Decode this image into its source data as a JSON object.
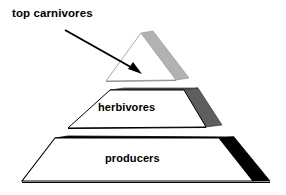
{
  "diagram": {
    "type": "ecological-energy-pyramid",
    "title": "",
    "orientation": "3d-perspective",
    "background_color": "#ffffff",
    "outline_color": "#000000",
    "tier_count": 3,
    "tiers": [
      {
        "name": "top-carnivores",
        "label": "top carnivores",
        "level": 3,
        "position": "apex",
        "shape": "triangle",
        "front_face_color": "#ffffff",
        "side_face_color": "#b2b2b2",
        "top_edge_color": "#b2b2b2",
        "label_placement": "external-left-with-arrow"
      },
      {
        "name": "herbivores",
        "label": "herbivores",
        "level": 2,
        "position": "middle",
        "shape": "trapezoid",
        "front_face_color": "#ffffff",
        "side_face_color": "#5e5e5e",
        "top_edge_color": "#4a4a4a",
        "label_placement": "inside"
      },
      {
        "name": "producers",
        "label": "producers",
        "level": 1,
        "position": "base",
        "shape": "trapezoid",
        "front_face_color": "#ffffff",
        "side_face_color": "#000000",
        "top_edge_color": "#000000",
        "label_placement": "inside"
      }
    ],
    "annotations": [
      {
        "name": "top-carnivores-pointer",
        "type": "arrow",
        "from": "top carnivores",
        "to": "apex tier",
        "color": "#000000",
        "start": [
          65,
          30
        ],
        "end": [
          141,
          74
        ]
      }
    ]
  }
}
